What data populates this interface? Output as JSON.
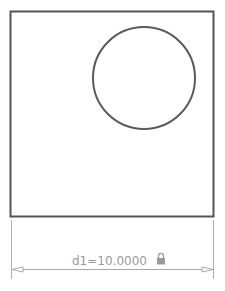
{
  "sketch": {
    "shapes": [
      {
        "type": "square",
        "label": "outer-square"
      },
      {
        "type": "circle",
        "label": "inner-circle"
      }
    ],
    "dimension": {
      "name": "d1",
      "value": "10.0000",
      "text": "d1=10.0000",
      "locked": true,
      "lock_icon": "lock-icon"
    },
    "colors": {
      "geometry": "#555555",
      "dimension": "#a8a8a8",
      "background": "#ffffff"
    }
  }
}
